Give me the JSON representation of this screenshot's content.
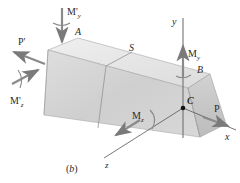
{
  "figure": {
    "caption": "(b)"
  },
  "points": {
    "A": "A",
    "S": "S",
    "B": "B",
    "C": "C"
  },
  "axes": {
    "x": "x",
    "y": "y",
    "z": "z"
  },
  "loads": {
    "P": "P",
    "P_prime": "P'",
    "My": "M",
    "My_sub": "y",
    "Mz": "M",
    "Mz_sub": "z",
    "My_prime": "M'",
    "My_prime_sub": "y",
    "Mz_prime": "M'",
    "Mz_prime_sub": "z"
  },
  "colors": {
    "block_light": "#e4e4e4",
    "block_mid": "#cfcfcf",
    "block_dark": "#bdbdbd",
    "edge": "#9a9a9a",
    "arrow": "#7a7a7a",
    "axis": "#555555",
    "text": "#2a2a2a"
  }
}
